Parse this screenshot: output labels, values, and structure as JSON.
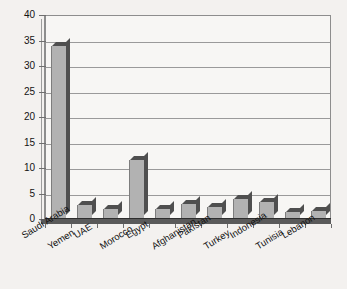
{
  "chart_data": {
    "type": "bar",
    "title": "",
    "subtitle": "",
    "xlabel": "",
    "ylabel": "",
    "categories": [
      "Saudi Arabia",
      "Yemen",
      "UAE",
      "Morocco",
      "Egypt",
      "Afghanistan",
      "Pakistan",
      "Turkey",
      "Indonesia",
      "Tunisia",
      "Lebanon"
    ],
    "values": [
      34,
      2.7,
      2,
      11.5,
      2,
      3,
      2.4,
      4,
      3.3,
      1.3,
      1.5
    ],
    "ylim": [
      0,
      40
    ],
    "yticks": [
      0,
      5,
      10,
      15,
      20,
      25,
      30,
      35,
      40
    ],
    "ytick_labels": [
      "0",
      "5",
      "10",
      "15",
      "20",
      "25",
      "30",
      "35",
      "40"
    ],
    "grid": true,
    "grid_axis": "y",
    "legend": false,
    "style": "3d-bar",
    "colors": {
      "bar_face": "#b2b2b2",
      "bar_shade": "#4f4f4f",
      "plot_background": "#f7f6f4",
      "figure_background": "#f3f1ef",
      "gridline": "#9a9a9a",
      "axis": "#8d8d8d",
      "text": "#121212"
    }
  }
}
